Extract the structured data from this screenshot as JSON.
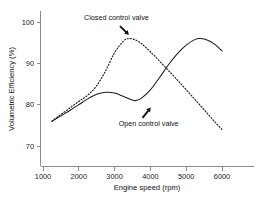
{
  "chart_data": {
    "type": "line",
    "title": "",
    "xlabel": "Engine speed (rpm)",
    "ylabel": "Volumetric Efficiency (%)",
    "xlim": [
      800,
      6300
    ],
    "ylim": [
      66,
      102
    ],
    "xticks": [
      1000,
      2000,
      3000,
      4000,
      5000,
      6000
    ],
    "xtick_labels": [
      "1000",
      "2000",
      "3000",
      "4000",
      "5000",
      "6000"
    ],
    "yticks": [
      70,
      80,
      90,
      100
    ],
    "ytick_labels": [
      "70",
      "80",
      "90",
      "100"
    ],
    "grid": false,
    "legend_position": "annotations",
    "series": [
      {
        "name": "Closed control valve",
        "style": "dotted",
        "x": [
          1250,
          1500,
          1750,
          2000,
          2250,
          2500,
          2750,
          3000,
          3250,
          3400,
          3600,
          3800,
          4000,
          4250,
          4500,
          4750,
          5000,
          5250,
          5500,
          5750,
          6000
        ],
        "values": [
          76.0,
          77.6,
          79.2,
          80.8,
          82.3,
          84.6,
          88.2,
          92.6,
          95.4,
          96.0,
          95.6,
          94.4,
          92.8,
          90.6,
          88.3,
          86.0,
          83.6,
          81.2,
          78.8,
          76.3,
          74.0
        ]
      },
      {
        "name": "Open control valve",
        "style": "solid",
        "x": [
          1250,
          1500,
          1750,
          2000,
          2250,
          2500,
          2750,
          3000,
          3250,
          3500,
          3600,
          3750,
          4000,
          4250,
          4500,
          4750,
          5000,
          5250,
          5400,
          5600,
          5800,
          6000
        ],
        "values": [
          76.0,
          77.3,
          78.6,
          80.0,
          81.4,
          82.5,
          83.0,
          82.8,
          82.0,
          81.1,
          81.0,
          81.6,
          83.6,
          86.5,
          89.6,
          92.3,
          94.4,
          95.8,
          96.0,
          95.6,
          94.6,
          93.0
        ]
      }
    ],
    "annotations": [
      {
        "label": "Closed control valve",
        "text_x": 3050,
        "text_y": 100.6,
        "arrow_from_x": 3150,
        "arrow_from_y": 99.0,
        "arrow_to_x": 3400,
        "arrow_to_y": 96.9
      },
      {
        "label": "Open control valve",
        "text_x": 3950,
        "text_y": 74.9,
        "arrow_from_x": 3780,
        "arrow_from_y": 76.8,
        "arrow_to_x": 4010,
        "arrow_to_y": 79.3
      }
    ],
    "colors": {
      "series_line": "#1d1d1d",
      "axis": "#8a8a8a",
      "text": "#111111",
      "background": "#ffffff"
    }
  }
}
